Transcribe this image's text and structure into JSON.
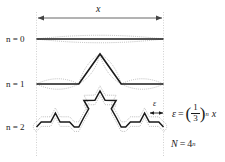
{
  "figure": {
    "type": "diagram",
    "background_color": "#ffffff",
    "curve_color": "#1a1a1a",
    "halo_color": "#9a9a9a",
    "guide_color": "#bfbfbf",
    "arrow_color": "#555555"
  },
  "width_measure": {
    "label": "x",
    "arrow": "double-headed-horizontal-arrow"
  },
  "iterations": [
    {
      "label_n": "n",
      "label_eq": "=",
      "label_value": "0",
      "label": "n = 0",
      "segments": 1
    },
    {
      "label_n": "n",
      "label_eq": "=",
      "label_value": "1",
      "label": "n = 1",
      "segments": 4
    },
    {
      "label_n": "n",
      "label_eq": "=",
      "label_value": "2",
      "label": "n = 2",
      "segments": 16
    }
  ],
  "epsilon_measure": {
    "label": "ε",
    "arrow": "double-headed-horizontal-arrow"
  },
  "equations": {
    "epsilon": {
      "lhs": "ε",
      "equals": "=",
      "numerator": "1",
      "denominator": "3",
      "exponent": "n",
      "trailing": "x",
      "full": "ε = (1/3)^n x"
    },
    "count": {
      "lhs": "N",
      "equals": "=",
      "base": "4",
      "exponent": "n",
      "full": "N = 4^n"
    }
  }
}
